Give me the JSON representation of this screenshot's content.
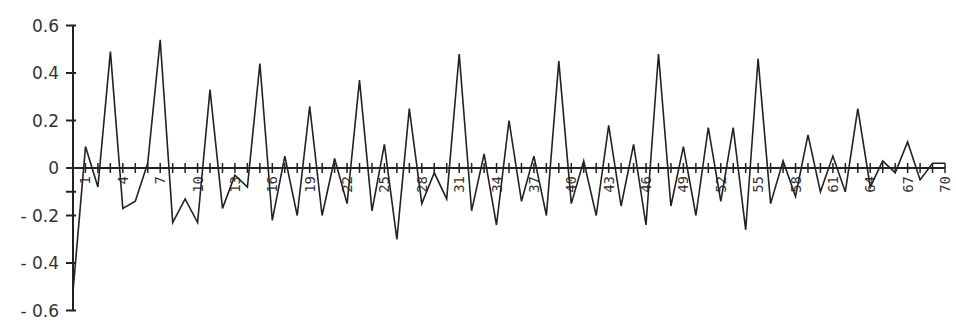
{
  "chart_data": {
    "type": "line",
    "title": "",
    "xlabel": "",
    "ylabel": "",
    "ylim": [
      -0.6,
      0.6
    ],
    "xlim": [
      0,
      70
    ],
    "grid": false,
    "legend": null,
    "y_ticks": [
      0.6,
      0.4,
      0.2,
      0,
      -0.2,
      -0.4,
      -0.6
    ],
    "y_tick_labels": [
      "0.6",
      "0.4",
      "0.2",
      "0",
      "- 0.2",
      "- 0.4",
      "- 0.6"
    ],
    "x_tick_labels": [
      "1",
      "4",
      "7",
      "10",
      "13",
      "16",
      "19",
      "22",
      "25",
      "28",
      "31",
      "34",
      "37",
      "40",
      "43",
      "46",
      "49",
      "52",
      "55",
      "58",
      "61",
      "64",
      "67",
      "70"
    ],
    "x_label_rotation": -90,
    "series": [
      {
        "name": "series",
        "color": "#222222",
        "x": [
          0,
          1,
          2,
          3,
          4,
          5,
          6,
          7,
          8,
          9,
          10,
          11,
          12,
          13,
          14,
          15,
          16,
          17,
          18,
          19,
          20,
          21,
          22,
          23,
          24,
          25,
          26,
          27,
          28,
          29,
          30,
          31,
          32,
          33,
          34,
          35,
          36,
          37,
          38,
          39,
          40,
          41,
          42,
          43,
          44,
          45,
          46,
          47,
          48,
          49,
          50,
          51,
          52,
          53,
          54,
          55,
          56,
          57,
          58,
          59,
          60,
          61,
          62,
          63,
          64,
          65,
          66,
          67,
          68,
          69,
          70
        ],
        "values": [
          -0.52,
          0.09,
          -0.08,
          0.49,
          -0.17,
          -0.14,
          0.02,
          0.54,
          -0.23,
          -0.13,
          -0.23,
          0.33,
          -0.17,
          -0.03,
          -0.08,
          0.44,
          -0.22,
          0.05,
          -0.2,
          0.26,
          -0.2,
          0.04,
          -0.15,
          0.37,
          -0.18,
          0.1,
          -0.3,
          0.25,
          -0.15,
          -0.02,
          -0.13,
          0.48,
          -0.18,
          0.06,
          -0.24,
          0.2,
          -0.14,
          0.05,
          -0.2,
          0.45,
          -0.15,
          0.03,
          -0.2,
          0.18,
          -0.16,
          0.1,
          -0.24,
          0.48,
          -0.16,
          0.09,
          -0.2,
          0.17,
          -0.14,
          0.17,
          -0.26,
          0.46,
          -0.15,
          0.03,
          -0.12,
          0.14,
          -0.1,
          0.05,
          -0.1,
          0.25,
          -0.08,
          0.03,
          -0.02,
          0.11,
          -0.05,
          0.02,
          0.02
        ]
      }
    ]
  }
}
